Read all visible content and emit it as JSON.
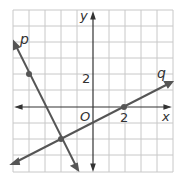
{
  "graph": {
    "x_axis_label": "x",
    "y_axis_label": "y",
    "origin_label": "O",
    "x_tick_label": "2",
    "y_tick_label": "2",
    "line_p_label": "p",
    "line_q_label": "q",
    "grid": {
      "xmin": -5,
      "xmax": 5,
      "ymin": -4,
      "ymax": 6
    },
    "points": [
      {
        "name": "point-on-p",
        "x": -4,
        "y": 2
      },
      {
        "name": "intersection",
        "x": -2,
        "y": -2
      },
      {
        "name": "point-on-q",
        "x": 2,
        "y": 0
      }
    ],
    "colors": {
      "grid": "#c8c8c8",
      "line": "#555555",
      "axis": "#333333"
    }
  }
}
